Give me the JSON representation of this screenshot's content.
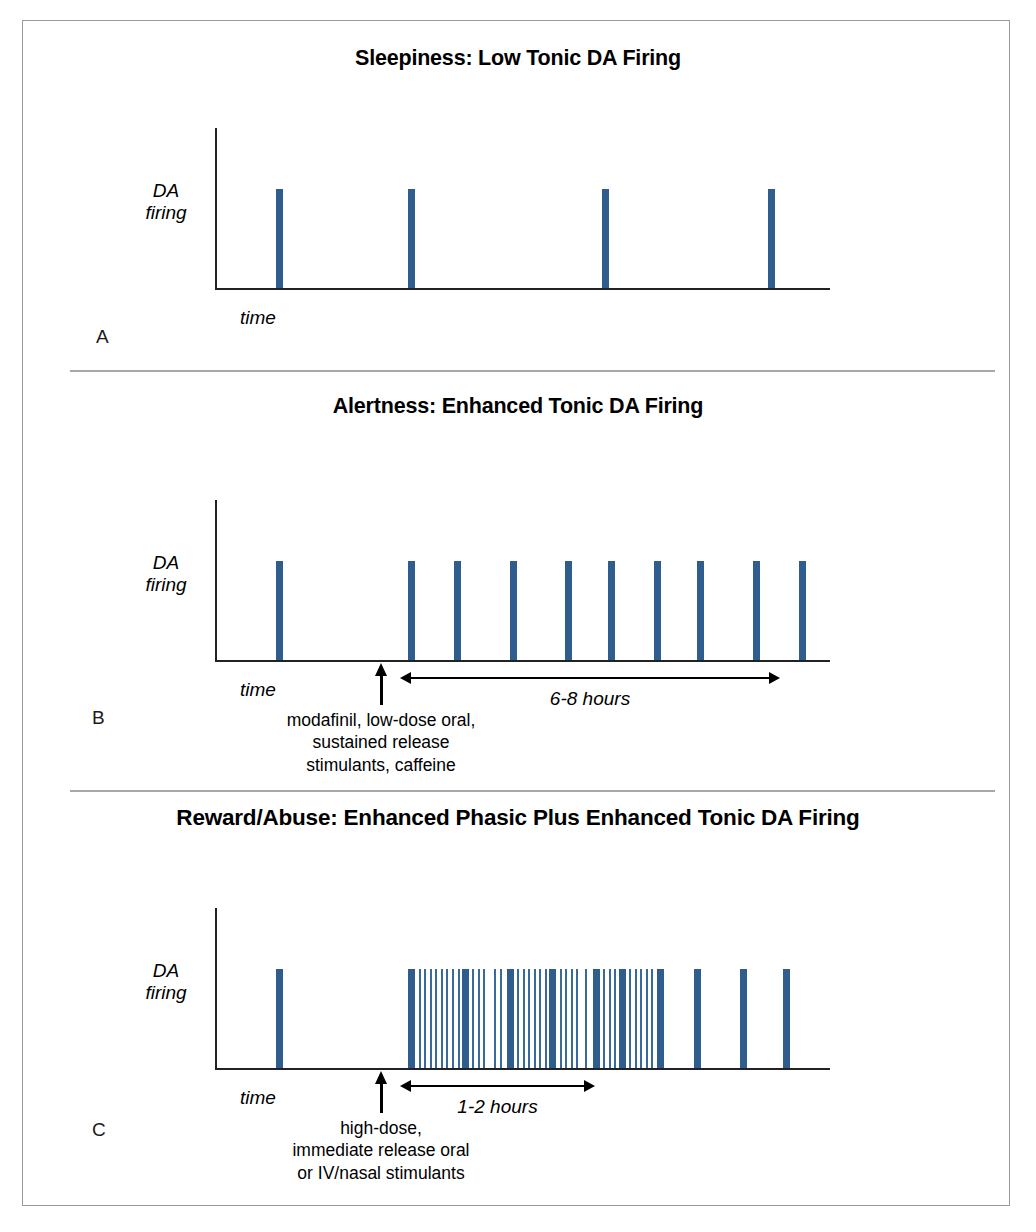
{
  "figure": {
    "background": "#ffffff",
    "border_color": "#9a9a9a",
    "divider_color": "#a8a8a8",
    "spike_color": "#2e5d8e",
    "axis_color": "#222222"
  },
  "panels": [
    {
      "letter": "A",
      "title": "Sleepiness: Low Tonic DA Firing",
      "ylabel": "DA\nfiring",
      "xlabel": "time"
    },
    {
      "letter": "B",
      "title": "Alertness: Enhanced Tonic DA Firing",
      "ylabel": "DA\nfiring",
      "xlabel": "time",
      "duration_label": "6-8 hours",
      "dose_caption": "modafinil, low-dose oral,\nsustained release\nstimulants, caffeine"
    },
    {
      "letter": "C",
      "title": "Reward/Abuse: Enhanced Phasic Plus Enhanced Tonic DA Firing",
      "ylabel": "DA\nfiring",
      "xlabel": "time",
      "duration_label": "1-2 hours",
      "dose_caption": "high-dose,\nimmediate release oral\nor IV/nasal stimulants"
    }
  ],
  "chart_data": [
    {
      "type": "bar",
      "panel": "A",
      "title": "Sleepiness: Low Tonic DA Firing",
      "xlabel": "time",
      "ylabel": "DA firing",
      "description": "Four widely and evenly spaced tonic dopamine spikes of equal amplitude.",
      "grid": false,
      "legend": "none",
      "xlim": [
        0,
        100
      ],
      "ylim": [
        0,
        1
      ],
      "series": [
        {
          "name": "tonic spikes",
          "kind": "tonic",
          "color": "#2e5d8e",
          "amplitude": 0.62,
          "width_px": 7,
          "x": [
            10.5,
            32.0,
            63.5,
            90.5
          ]
        }
      ]
    },
    {
      "type": "bar",
      "panel": "B",
      "title": "Alertness: Enhanced Tonic DA Firing",
      "xlabel": "time",
      "ylabel": "DA firing",
      "description": "One baseline tonic spike, then after drug administration a sustained run of ten evenly spaced tonic spikes spanning 6-8 hours.",
      "grid": false,
      "legend": "none",
      "xlim": [
        0,
        100
      ],
      "ylim": [
        0,
        1
      ],
      "annotations": [
        {
          "type": "up-arrow",
          "x": 32.0,
          "label": "modafinil, low-dose oral, sustained release stimulants, caffeine"
        },
        {
          "type": "span-arrow",
          "x_start": 35.5,
          "x_end": 96.0,
          "label": "6-8 hours"
        }
      ],
      "series": [
        {
          "name": "baseline tonic spike",
          "kind": "tonic",
          "color": "#2e5d8e",
          "amplitude": 0.62,
          "width_px": 7,
          "x": [
            10.5
          ]
        },
        {
          "name": "enhanced tonic spikes",
          "kind": "tonic",
          "color": "#2e5d8e",
          "amplitude": 0.62,
          "width_px": 7,
          "x": [
            32.0,
            39.5,
            48.5,
            57.5,
            64.5,
            72.0,
            79.0,
            88.0,
            95.5
          ]
        }
      ]
    },
    {
      "type": "bar",
      "panel": "C",
      "title": "Reward/Abuse: Enhanced Phasic Plus Enhanced Tonic DA Firing",
      "xlabel": "time",
      "ylabel": "DA firing",
      "description": "One baseline tonic spike, then a dense 1-2 hour burst of thick tonic spikes interleaved with many thin high-frequency phasic spikes, followed by spaced tonic spikes.",
      "grid": false,
      "legend": "none",
      "xlim": [
        0,
        100
      ],
      "ylim": [
        0,
        1
      ],
      "annotations": [
        {
          "type": "up-arrow",
          "x": 32.0,
          "label": "high-dose, immediate release oral or IV/nasal stimulants"
        },
        {
          "type": "span-arrow",
          "x_start": 35.5,
          "x_end": 66.0,
          "label": "1-2 hours"
        }
      ],
      "series": [
        {
          "name": "baseline tonic spike",
          "kind": "tonic",
          "color": "#2e5d8e",
          "amplitude": 0.62,
          "width_px": 7,
          "x": [
            10.5
          ]
        },
        {
          "name": "burst tonic spikes",
          "kind": "tonic",
          "color": "#2e5d8e",
          "amplitude": 0.62,
          "width_px": 7,
          "x": [
            32.0,
            40.8,
            48.0,
            54.9,
            62.0,
            66.2,
            72.5,
            78.5,
            86.0,
            93.0
          ]
        },
        {
          "name": "phasic spikes",
          "kind": "phasic",
          "color": "#3a6a9c",
          "amplitude": 0.62,
          "width_px": 2,
          "x": [
            33.3,
            34.2,
            35.1,
            36.0,
            36.9,
            37.8,
            38.7,
            39.6,
            42.0,
            42.9,
            43.8,
            45.6,
            46.5,
            49.3,
            50.2,
            51.1,
            52.0,
            52.9,
            53.8,
            56.2,
            57.1,
            58.0,
            58.9,
            60.4,
            63.3,
            64.2,
            65.1,
            67.5,
            68.4,
            69.3,
            70.2,
            71.1
          ]
        }
      ]
    }
  ]
}
